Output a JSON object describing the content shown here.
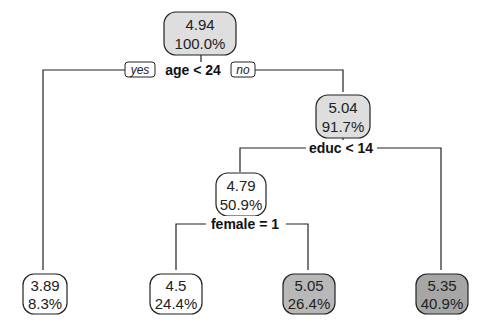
{
  "tree": {
    "nodes": {
      "root": {
        "value": "4.94",
        "pct": "100.0%",
        "fill": "#dedede"
      },
      "n_age_no": {
        "value": "5.04",
        "pct": "91.7%",
        "fill": "#dedede"
      },
      "n_educ_yes": {
        "value": "4.79",
        "pct": "50.9%",
        "fill": "#ffffff"
      },
      "leaf_age_yes": {
        "value": "3.89",
        "pct": "8.3%",
        "fill": "#ffffff"
      },
      "leaf_female_yes": {
        "value": "4.5",
        "pct": "24.4%",
        "fill": "#ffffff"
      },
      "leaf_female_no": {
        "value": "5.05",
        "pct": "26.4%",
        "fill": "#b8b8b8"
      },
      "leaf_educ_no": {
        "value": "5.35",
        "pct": "40.9%",
        "fill": "#a6a6a6"
      }
    },
    "splits": {
      "age": "age < 24",
      "educ": "educ < 14",
      "female": "female = 1"
    },
    "branch_labels": {
      "yes": "yes",
      "no": "no"
    }
  }
}
